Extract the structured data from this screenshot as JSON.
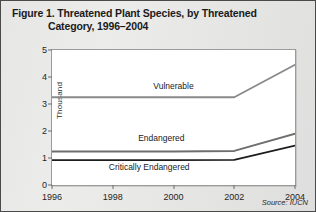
{
  "figure": {
    "title_line1": "Figure 1. Threatened Plant Species, by Threatened",
    "title_line2": "Category, 1996–2004",
    "source": "Source: IUCN"
  },
  "chart_data": {
    "type": "line",
    "title": "Figure 1. Threatened Plant Species, by Threatened Category, 1996–2004",
    "xlabel": "",
    "ylabel": "Thousand",
    "x": [
      1996,
      1998,
      2000,
      2002,
      2004
    ],
    "xtick_labels": [
      "1996",
      "1998",
      "2000",
      "2002",
      "2004"
    ],
    "ytick_labels": [
      "0",
      "1",
      "2",
      "3",
      "4",
      "5"
    ],
    "yticks": [
      0,
      1,
      2,
      3,
      4,
      5
    ],
    "xlim": [
      1996,
      2004
    ],
    "ylim": [
      0,
      5
    ],
    "grid": false,
    "legend": "inline-labels",
    "series": [
      {
        "name": "Vulnerable",
        "color": "#8a8a8a",
        "values": [
          3.25,
          3.25,
          3.25,
          3.25,
          4.45
        ],
        "label_x": 2000,
        "label_y": 3.62
      },
      {
        "name": "Endangered",
        "color": "#6e6e6e",
        "values": [
          1.24,
          1.24,
          1.24,
          1.26,
          1.9
        ],
        "label_x": 1999.6,
        "label_y": 1.72
      },
      {
        "name": "Critically Endangered",
        "color": "#1c1c1c",
        "values": [
          0.92,
          0.92,
          0.92,
          0.93,
          1.46
        ],
        "label_x": 1999.2,
        "label_y": 0.62
      }
    ]
  }
}
